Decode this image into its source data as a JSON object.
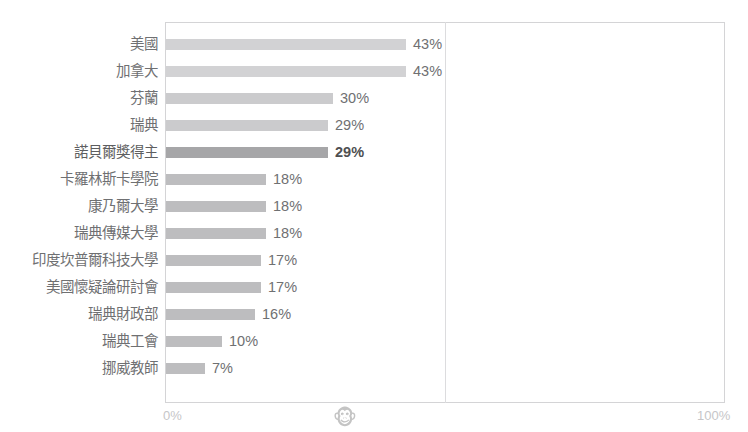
{
  "clipped_top_text": "",
  "chart_data": {
    "type": "bar",
    "orientation": "horizontal",
    "title": "",
    "xlabel": "",
    "ylabel": "",
    "xlim": [
      0,
      100
    ],
    "grid": true,
    "legend": false,
    "categories": [
      "美國",
      "加拿大",
      "芬蘭",
      "瑞典",
      "諾貝爾獎得主",
      "卡羅林斯卡學院",
      "康乃爾大學",
      "瑞典傳媒大學",
      "印度坎普爾科技大學",
      "美國懷疑論研討會",
      "瑞典財政部",
      "瑞典工會",
      "挪威教師"
    ],
    "values": [
      43,
      43,
      30,
      29,
      29,
      18,
      18,
      18,
      17,
      17,
      16,
      10,
      7
    ],
    "value_labels": [
      "43%",
      "43%",
      "30%",
      "29%",
      "29%",
      "18%",
      "18%",
      "18%",
      "17%",
      "17%",
      "16%",
      "10%",
      "7%"
    ],
    "highlight_index": 4,
    "bar_tones": [
      "tone-light",
      "tone-light",
      "tone-lighter",
      "tone-lighter",
      "tone-dark",
      "tone-mid",
      "tone-mid",
      "tone-mid",
      "tone-mid",
      "tone-mid",
      "tone-mid",
      "tone-mid",
      "tone-mid"
    ],
    "xticks": [
      {
        "value": 0,
        "label": "0%"
      },
      {
        "value": 50,
        "label": "🐵",
        "is_glyph": true,
        "glyph_name": "monkey-face-emoji"
      },
      {
        "value": 100,
        "label": "100%"
      }
    ],
    "colors": {
      "bar_light": "#d2d2d4",
      "bar_lighter": "#cbcbcd",
      "bar_mid": "#bdbdbf",
      "bar_dark": "#a6a6a8",
      "label_text": "#6f7072",
      "tick_text": "#c6c6c8",
      "plot_border": "#d4d4d6",
      "gridline": "#dcdcde",
      "background": "#ffffff"
    }
  },
  "axis": {
    "tick_0": "0%",
    "tick_mid_glyph": "🐵",
    "tick_100": "100%"
  }
}
